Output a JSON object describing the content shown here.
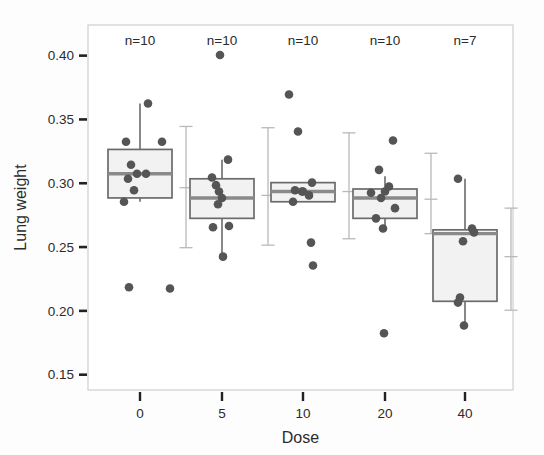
{
  "figure": {
    "background": "#fdfdfd",
    "frame_color": "#cfcfcf",
    "box_fill": "#f2f2f2",
    "box_edge": "#6b6b6b",
    "median_color": "#8a8a8a",
    "point_color": "#555555",
    "errorbar_color": "#b9b9b9",
    "whisker_color": "#6b6b6b"
  },
  "chart_data": {
    "type": "box",
    "title": "",
    "xlabel": "Dose",
    "ylabel": "Lung weight",
    "xlim_categories": [
      "0",
      "5",
      "10",
      "20",
      "40"
    ],
    "xticklabels": [
      "0",
      "5",
      "10",
      "20",
      "40"
    ],
    "yticklabels": [
      "0.40",
      "0.35",
      "0.30",
      "0.25",
      "0.20",
      "0.15"
    ],
    "yticks": [
      0.4,
      0.35,
      0.3,
      0.25,
      0.2,
      0.15
    ],
    "ylim": [
      0.138,
      0.424
    ],
    "grid": false,
    "legend": "none",
    "annotations": [
      "n=10",
      "n=10",
      "n=10",
      "n=10",
      "n=7"
    ],
    "groups": [
      {
        "label": "0",
        "n_label": "n=10",
        "n": 10,
        "box": {
          "q1": 0.2885,
          "median": 0.3075,
          "q3": 0.3265,
          "whisker_low": 0.2855,
          "whisker_high": 0.3625
        },
        "errorbar": {
          "mean": 0.2965,
          "low": 0.2495,
          "high": 0.3445
        },
        "points": [
          0.3625,
          0.3325,
          0.3325,
          0.3145,
          0.3075,
          0.3075,
          0.3035,
          0.2945,
          0.2855,
          0.2185
        ],
        "extra_points": [
          0.2175
        ]
      },
      {
        "label": "5",
        "n_label": "n=10",
        "n": 10,
        "box": {
          "q1": 0.2725,
          "median": 0.2885,
          "q3": 0.3035,
          "whisker_low": 0.2425,
          "whisker_high": 0.3185
        },
        "errorbar": {
          "mean": 0.2905,
          "low": 0.2515,
          "high": 0.3435
        },
        "points": [
          0.4005,
          0.3185,
          0.3045,
          0.2985,
          0.2935,
          0.2885,
          0.2835,
          0.2665,
          0.2655,
          0.2425
        ]
      },
      {
        "label": "10",
        "n_label": "n=10",
        "n": 10,
        "box": {
          "q1": 0.2855,
          "median": 0.2935,
          "q3": 0.3005,
          "whisker_low": 0.2855,
          "whisker_high": 0.3005
        },
        "errorbar": {
          "mean": 0.2935,
          "low": 0.2565,
          "high": 0.3395
        },
        "points": [
          0.3695,
          0.3405,
          0.3005,
          0.2945,
          0.2935,
          0.2905,
          0.2855,
          0.2535,
          0.2355,
          0.2935
        ]
      },
      {
        "label": "20",
        "n_label": "n=10",
        "n": 10,
        "box": {
          "q1": 0.2725,
          "median": 0.2885,
          "q3": 0.2955,
          "whisker_low": 0.2645,
          "whisker_high": 0.3055
        },
        "errorbar": {
          "mean": 0.2875,
          "low": 0.2605,
          "high": 0.3235
        },
        "points": [
          0.3335,
          0.3105,
          0.2975,
          0.2935,
          0.2925,
          0.2885,
          0.2805,
          0.2725,
          0.2645,
          0.1825
        ]
      },
      {
        "label": "40",
        "n_label": "n=7",
        "n": 7,
        "box": {
          "q1": 0.2075,
          "median": 0.2605,
          "q3": 0.2635,
          "whisker_low": 0.1885,
          "whisker_high": 0.3035
        },
        "errorbar": {
          "mean": 0.2425,
          "low": 0.2005,
          "high": 0.2805
        },
        "points": [
          0.3035,
          0.2645,
          0.2615,
          0.2545,
          0.2105,
          0.2065,
          0.1885
        ]
      }
    ]
  }
}
